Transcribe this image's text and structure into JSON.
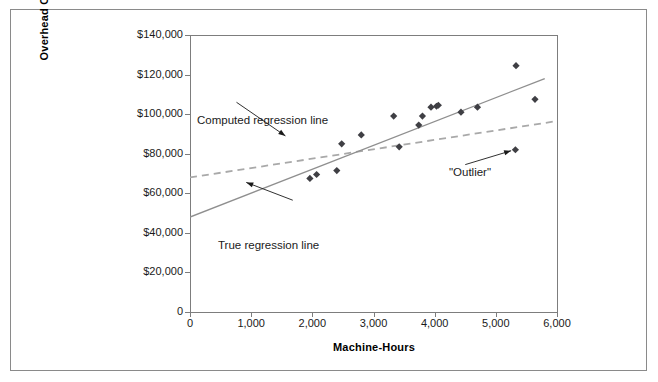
{
  "chart_data": {
    "type": "scatter",
    "title": "",
    "xlabel": "Machine-Hours",
    "ylabel": "Overhead Cost",
    "xlim": [
      0,
      6000
    ],
    "ylim": [
      0,
      140000
    ],
    "grid": false,
    "legend_position": "none",
    "x_tick_labels": [
      "0",
      "1,000",
      "2,000",
      "3,000",
      "4,000",
      "5,000",
      "6,000"
    ],
    "x_tick_values": [
      0,
      1000,
      2000,
      3000,
      4000,
      5000,
      6000
    ],
    "y_tick_labels": [
      "0",
      "$20,000",
      "$40,000",
      "$60,000",
      "$80,000",
      "$100,000",
      "$120,000",
      "$140,000"
    ],
    "y_tick_values": [
      0,
      20000,
      40000,
      60000,
      80000,
      100000,
      120000,
      140000
    ],
    "series": [
      {
        "name": "Observations",
        "marker": "diamond",
        "color": "#3f3f44",
        "points": [
          {
            "x": 1960,
            "y": 67500
          },
          {
            "x": 2070,
            "y": 69500
          },
          {
            "x": 2400,
            "y": 71500
          },
          {
            "x": 2480,
            "y": 85000
          },
          {
            "x": 2800,
            "y": 89500
          },
          {
            "x": 3330,
            "y": 99000
          },
          {
            "x": 3420,
            "y": 83500
          },
          {
            "x": 3740,
            "y": 94500
          },
          {
            "x": 3800,
            "y": 99000
          },
          {
            "x": 3940,
            "y": 103500
          },
          {
            "x": 4030,
            "y": 104000
          },
          {
            "x": 4060,
            "y": 104500
          },
          {
            "x": 4430,
            "y": 101000
          },
          {
            "x": 4700,
            "y": 103500
          },
          {
            "x": 5330,
            "y": 124500
          },
          {
            "x": 5320,
            "y": 82000
          },
          {
            "x": 5640,
            "y": 107500
          }
        ]
      }
    ],
    "lines": [
      {
        "name": "Computed regression line",
        "style": "dashed",
        "color": "#a9a9a9",
        "x_start": 0,
        "y_start": 68000,
        "x_end": 6000,
        "y_end": 96500
      },
      {
        "name": "True regression line",
        "style": "solid",
        "color": "#8f8f8f",
        "x_start": 0,
        "y_start": 48000,
        "x_end": 5800,
        "y_end": 118000
      }
    ],
    "annotations": [
      {
        "id": "computed-regression-line",
        "text": "Computed regression line",
        "arrow_from": {
          "x": 760,
          "y": 106000
        },
        "arrow_to": {
          "x": 1560,
          "y": 89000
        }
      },
      {
        "id": "true-regression-line",
        "text": "True regression line",
        "arrow_from": {
          "x": 1680,
          "y": 56500
        },
        "arrow_to": {
          "x": 920,
          "y": 65500
        }
      },
      {
        "id": "outlier",
        "text": "\"Outlier\"",
        "arrow_from": {
          "x": 4500,
          "y": 74500
        },
        "arrow_to": {
          "x": 5250,
          "y": 81500
        }
      }
    ]
  },
  "axes": {
    "x_title": "Machine-Hours",
    "y_title": "Overhead Cost"
  }
}
